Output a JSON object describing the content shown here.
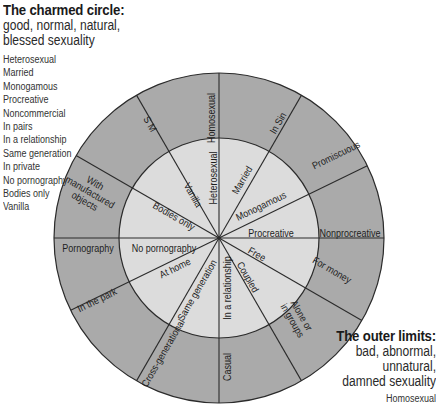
{
  "charmed": {
    "title": "The charmed circle:",
    "subtitle_lines": [
      "good, normal, natural,",
      "blessed sexuality"
    ],
    "items": [
      "Heterosexual",
      "Married",
      "Monogamous",
      "Procreative",
      "Noncommercial",
      "In pairs",
      "In a relationship",
      "Same generation",
      "In private",
      "No pornography",
      "Bodies only",
      "Vanilla"
    ]
  },
  "outer_limits": {
    "title": "The outer limits:",
    "subtitle_lines": [
      "bad, abnormal,",
      "unnatural,",
      "damned sexuality"
    ],
    "items": [
      "Homosexual"
    ]
  },
  "diagram": {
    "colors": {
      "outer_ring": "#aaaaaa",
      "inner_circle": "#dcdcdc",
      "lines": "#2b2b2b"
    },
    "center": [
      219,
      238
    ],
    "outer_radius": 165,
    "inner_radius": 100,
    "spoke_angles": [
      90,
      60,
      26,
      0,
      -30,
      -60,
      -90,
      -120,
      -154,
      180,
      150,
      120
    ],
    "outer_labels": [
      {
        "lines": [
          "Homosexual"
        ],
        "x": 211,
        "y": 118,
        "rot": -90
      },
      {
        "lines": [
          "In Sin"
        ],
        "x": 278,
        "y": 123,
        "rot": -60
      },
      {
        "lines": [
          "Promiscuous"
        ],
        "x": 336,
        "y": 155,
        "rot": -26
      },
      {
        "lines": [
          "Nonprocreative"
        ],
        "x": 350,
        "y": 233,
        "rot": 0
      },
      {
        "lines": [
          "For money"
        ],
        "x": 332,
        "y": 270,
        "rot": 30
      },
      {
        "lines": [
          "Alone or",
          "in groups"
        ],
        "x": 297,
        "y": 318,
        "rot": 60
      },
      {
        "lines": [
          "Casual"
        ],
        "x": 227,
        "y": 367,
        "rot": -90
      },
      {
        "lines": [
          "Cross-generational"
        ],
        "x": 163,
        "y": 353,
        "rot": -60
      },
      {
        "lines": [
          "In the park"
        ],
        "x": 97,
        "y": 300,
        "rot": -26
      },
      {
        "lines": [
          "Pornography"
        ],
        "x": 88,
        "y": 248,
        "rot": 0
      },
      {
        "lines": [
          "With",
          "manufactured",
          "objects"
        ],
        "x": 90,
        "y": 192,
        "rot": 30
      },
      {
        "lines": [
          "S M"
        ],
        "x": 150,
        "y": 124,
        "rot": 60
      }
    ],
    "inner_labels": [
      {
        "lines": [
          "Heterosexual"
        ],
        "x": 213,
        "y": 178,
        "rot": -90
      },
      {
        "lines": [
          "Married"
        ],
        "x": 242,
        "y": 180,
        "rot": -60
      },
      {
        "lines": [
          "Monogamous"
        ],
        "x": 261,
        "y": 206,
        "rot": -26
      },
      {
        "lines": [
          "Procreative"
        ],
        "x": 271,
        "y": 233,
        "rot": 0
      },
      {
        "lines": [
          "Free"
        ],
        "x": 257,
        "y": 254,
        "rot": 30
      },
      {
        "lines": [
          "Coupled"
        ],
        "x": 248,
        "y": 277,
        "rot": 60
      },
      {
        "lines": [
          "In a relationship"
        ],
        "x": 227,
        "y": 288,
        "rot": -90
      },
      {
        "lines": [
          "Same generation"
        ],
        "x": 197,
        "y": 290,
        "rot": -60
      },
      {
        "lines": [
          "At home"
        ],
        "x": 175,
        "y": 268,
        "rot": -26
      },
      {
        "lines": [
          "No pornography"
        ],
        "x": 164,
        "y": 248,
        "rot": 0
      },
      {
        "lines": [
          "Bodies only"
        ],
        "x": 174,
        "y": 216,
        "rot": 30
      },
      {
        "lines": [
          "Vanilla"
        ],
        "x": 193,
        "y": 195,
        "rot": 60
      }
    ]
  }
}
